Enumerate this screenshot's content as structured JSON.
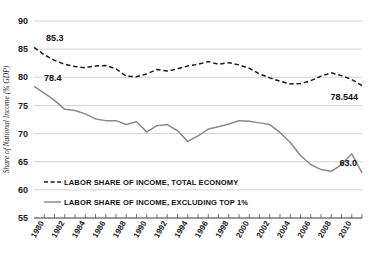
{
  "chart_data": {
    "type": "line",
    "title": "",
    "xlabel": "",
    "ylabel": "Share of National Income (% GDP)",
    "ylim": [
      55,
      90
    ],
    "xlim": [
      1979,
      2011
    ],
    "ytick_labels": [
      "90",
      "85",
      "80",
      "75",
      "70",
      "65",
      "60",
      "55"
    ],
    "ytick_values": [
      90,
      85,
      80,
      75,
      70,
      65,
      60,
      55
    ],
    "xtick_labels": [
      "1980",
      "1982",
      "1984",
      "1986",
      "1988",
      "1990",
      "1992",
      "1994",
      "1996",
      "1998",
      "2000",
      "2002",
      "2004",
      "2006",
      "2008",
      "2010"
    ],
    "xtick_values": [
      1980,
      1982,
      1984,
      1986,
      1988,
      1990,
      1992,
      1994,
      1996,
      1998,
      2000,
      2002,
      2004,
      2006,
      2008,
      2010
    ],
    "grid": true,
    "legend_position": "inside-lower-left",
    "x": [
      1979,
      1980,
      1981,
      1982,
      1983,
      1984,
      1985,
      1986,
      1987,
      1988,
      1989,
      1990,
      1991,
      1992,
      1993,
      1994,
      1995,
      1996,
      1997,
      1998,
      1999,
      2000,
      2001,
      2002,
      2003,
      2004,
      2005,
      2006,
      2007,
      2008,
      2009,
      2010,
      2011
    ],
    "series": [
      {
        "name": "Labor share of income, total economy",
        "style": "dashed",
        "color": "#1a1a1a",
        "values": [
          85.3,
          84.0,
          83.0,
          82.3,
          81.9,
          81.7,
          82.0,
          82.1,
          81.5,
          80.2,
          80.1,
          80.6,
          81.4,
          81.1,
          81.5,
          82.0,
          82.3,
          82.8,
          82.3,
          82.6,
          82.2,
          81.6,
          80.6,
          79.9,
          79.3,
          78.8,
          78.9,
          79.4,
          80.2,
          80.8,
          80.3,
          79.6,
          78.544
        ]
      },
      {
        "name": "Labor share of income, excluding top 1%",
        "style": "solid",
        "color": "#8a8a8a",
        "values": [
          78.4,
          77.2,
          75.9,
          74.3,
          74.1,
          73.5,
          72.6,
          72.3,
          72.3,
          71.6,
          72.1,
          70.3,
          71.4,
          71.6,
          70.5,
          68.6,
          69.6,
          70.8,
          71.2,
          71.7,
          72.3,
          72.2,
          71.9,
          71.6,
          70.2,
          68.4,
          66.1,
          64.5,
          63.6,
          63.3,
          64.5,
          66.4,
          63.0
        ]
      }
    ],
    "annotations": [
      {
        "label": "85.3",
        "series": "total-economy",
        "x": 1979,
        "y": 85.3
      },
      {
        "label": "78.4",
        "series": "excluding-top-1",
        "x": 1979,
        "y": 78.4
      },
      {
        "label": "78.544",
        "series": "total-economy",
        "x": 2011,
        "y": 78.544
      },
      {
        "label": "63.0",
        "series": "excluding-top-1",
        "x": 2011,
        "y": 63.0
      }
    ],
    "legend": [
      {
        "label": "LABOR SHARE OF INCOME, TOTAL ECONOMY",
        "style": "dashed",
        "color": "#1a1a1a"
      },
      {
        "label": "LABOR SHARE OF INCOME, EXCLUDING TOP 1%",
        "style": "solid",
        "color": "#8a8a8a"
      }
    ]
  },
  "colors": {
    "background": "#ffffff",
    "grid": "#c8c8c8",
    "axis": "#3a3a3a",
    "series_total": "#1a1a1a",
    "series_excluding": "#8a8a8a",
    "text": "#111111"
  }
}
